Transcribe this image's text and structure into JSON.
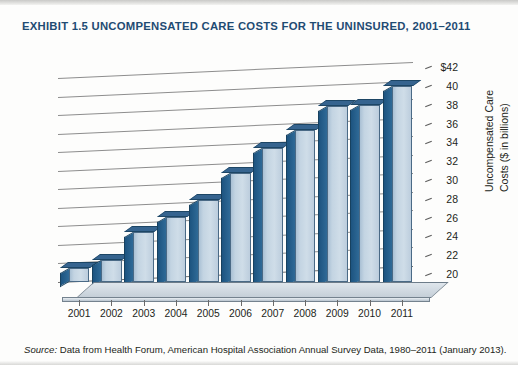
{
  "exhibit": {
    "title": "EXHIBIT 1.5  UNCOMPENSATED CARE COSTS FOR THE UNINSURED, 2001–2011",
    "title_color": "#1f4b73"
  },
  "source": {
    "label": "Source:",
    "text": "Data from Health Forum, American Hospital Association Annual Survey Data, 1980–2011 (January 2013)."
  },
  "chart_data": {
    "type": "bar",
    "title": "EXHIBIT 1.5  UNCOMPENSATED CARE COSTS FOR THE UNINSURED, 2001–2011",
    "xlabel": "Year",
    "ylabel": "Uncompensated Care Costs ($ in billions)",
    "ylabel_line1": "Uncompensated Care",
    "ylabel_line2": "Costs ($ in billions)",
    "categories": [
      "2001",
      "2002",
      "2003",
      "2004",
      "2005",
      "2006",
      "2007",
      "2008",
      "2009",
      "2010",
      "2011"
    ],
    "values": [
      21.5,
      22.4,
      25.4,
      27.0,
      28.8,
      31.8,
      34.4,
      36.4,
      39.0,
      39.1,
      41.1
    ],
    "ylim": [
      20,
      42
    ],
    "ytick_values": [
      20,
      22,
      24,
      26,
      28,
      30,
      32,
      34,
      36,
      38,
      40,
      42
    ],
    "ytick_labels": [
      "20",
      "22",
      "24",
      "26",
      "28",
      "30",
      "32",
      "34",
      "36",
      "38",
      "40",
      "$42"
    ],
    "grid": true,
    "legend": false,
    "bar_face_color": "#c3d4e2",
    "bar_side_color": "#2f6a97",
    "three_d": true
  }
}
